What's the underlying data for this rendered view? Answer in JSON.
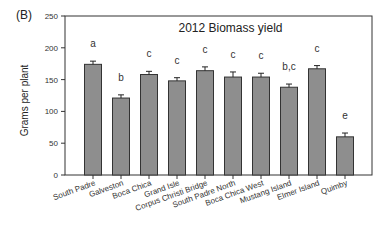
{
  "panel_label": "(B)",
  "chart_data": {
    "type": "bar",
    "title": "2012 Biomass yield",
    "xlabel": "",
    "ylabel": "Grams per plant",
    "ylim": [
      0,
      250
    ],
    "yticks": [
      0,
      50,
      100,
      150,
      200,
      250
    ],
    "grid": false,
    "legend": null,
    "categories": [
      "South Padre",
      "Galveston",
      "Boca Chica",
      "Grand Isle",
      "Corpus Christi Bridge",
      "South Padre North",
      "Boca Chica West",
      "Mustang Island",
      "Elmer Island",
      "Quimby"
    ],
    "values": [
      174,
      121,
      158,
      148,
      164,
      154,
      154,
      138,
      167,
      60
    ],
    "errors": [
      5,
      5,
      5,
      5,
      6,
      8,
      6,
      5,
      5,
      6
    ],
    "annotations": [
      "a",
      "b",
      "c",
      "c",
      "c",
      "c",
      "c",
      "b,c",
      "c",
      "e"
    ],
    "bar_color": "#8e8e8e",
    "edge_color": "#333333"
  }
}
